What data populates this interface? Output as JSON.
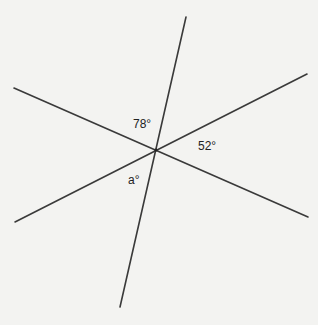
{
  "diagram": {
    "title": "",
    "lines": [
      {
        "name": "line-steep"
      },
      {
        "name": "line-descending"
      },
      {
        "name": "line-ascending"
      }
    ],
    "angle_labels": [
      {
        "name": "angle-78",
        "text": "78°"
      },
      {
        "name": "angle-52",
        "text": "52°"
      },
      {
        "name": "angle-a",
        "text": "a°"
      }
    ]
  }
}
